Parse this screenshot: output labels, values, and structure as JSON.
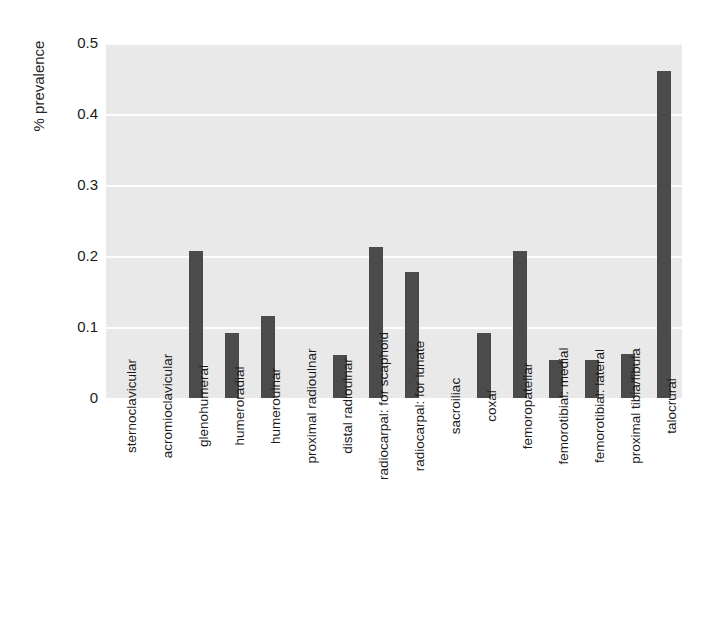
{
  "chart_data": {
    "type": "bar",
    "title": "",
    "subtitle": "",
    "xlabel": "",
    "ylabel": "% prevalence",
    "ylim": [
      0,
      0.5
    ],
    "yticks": [
      "0",
      "0.1",
      "0.2",
      "0.3",
      "0.4",
      "0.5"
    ],
    "ytick_values": [
      0,
      0.1,
      0.2,
      0.3,
      0.4,
      0.5
    ],
    "grid": "horizontal",
    "legend": "none",
    "bar_color": "#4b4b4b",
    "plot_background": "#e9e9e9",
    "gridline_color": "#fdfdfd",
    "categories": [
      "sternoclavicular",
      "acromioclavicular",
      "glenohumeral",
      "humeroradial",
      "humeroulnar",
      "proximal radioulnar",
      "distal radioulnar",
      "radiocarpal: for scaphoid",
      "radiocarpal: for lunate",
      "sacroiliac",
      "coxal",
      "femoropatellar",
      "femorotibial: medial",
      "femorotibial: lateral",
      "proximal tibia/fibula",
      "talocrural"
    ],
    "values": [
      0,
      0,
      0.207,
      0.092,
      0.116,
      0,
      0.061,
      0.212,
      0.178,
      0,
      0.092,
      0.207,
      0.054,
      0.054,
      0.062,
      0.461
    ]
  }
}
